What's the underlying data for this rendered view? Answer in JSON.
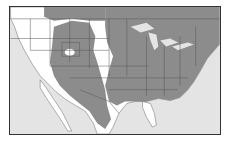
{
  "map": {
    "type": "species range map",
    "region": "United States, southern Canada and northern Mexico",
    "legend": [],
    "labels": [],
    "colors": {
      "range": "#8c8c8c",
      "outside_range_land": "#ffffff",
      "water": "#e4e4e4",
      "borders": "#555555",
      "frame": "#333333"
    },
    "features": [
      {
        "name": "range-shading-west",
        "description": "Gray range over Great Basin, Rockies, Southwest into Mexican plateau"
      },
      {
        "name": "range-shading-east",
        "description": "Gray range over central and eastern US and southern Canada"
      },
      {
        "name": "non-range-pacific-coast",
        "description": "White Pacific coast and Baja California"
      },
      {
        "name": "non-range-great-plains-strip",
        "description": "White north-south strip through Great Plains"
      },
      {
        "name": "non-range-florida",
        "description": "White southern Florida peninsula"
      },
      {
        "name": "great-lakes",
        "description": "Light water bodies"
      },
      {
        "name": "great-salt-lake-hole",
        "description": "White spot in Utah"
      }
    ]
  }
}
